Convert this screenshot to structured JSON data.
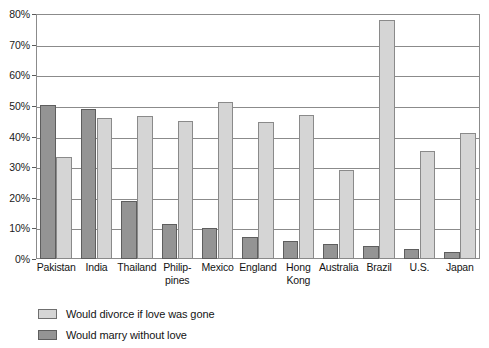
{
  "chart_data": {
    "type": "bar",
    "title": "",
    "subtitle": "",
    "xlabel": "",
    "ylabel": "",
    "ylim": [
      0,
      80
    ],
    "ytick_step": 10,
    "ytick_labels": [
      "0%",
      "10%",
      "20%",
      "30%",
      "40%",
      "50%",
      "60%",
      "70%",
      "80%"
    ],
    "grid": true,
    "legend_position": "below-plot-left",
    "orientation": "vertical",
    "grouping": "grouped",
    "categories": [
      "Pakistan",
      "India",
      "Thailand",
      "Philippines",
      "Mexico",
      "England",
      "Hong Kong",
      "Australia",
      "Brazil",
      "U.S.",
      "Japan"
    ],
    "category_label_lines": [
      [
        "Pakistan"
      ],
      [
        "India"
      ],
      [
        "Thailand"
      ],
      [
        "Philip-",
        "pines"
      ],
      [
        "Mexico"
      ],
      [
        "England"
      ],
      [
        "Hong",
        "Kong"
      ],
      [
        "Australia"
      ],
      [
        "Brazil"
      ],
      [
        "U.S."
      ],
      [
        "Japan"
      ]
    ],
    "series": [
      {
        "name": "Would marry without love",
        "color": "#949494",
        "values": [
          50.4,
          49.0,
          18.8,
          11.4,
          10.2,
          7.3,
          5.8,
          4.8,
          4.3,
          3.4,
          2.3
        ]
      },
      {
        "name": "Would divorce if love was gone",
        "color": "#d5d5d5",
        "values": [
          33.2,
          46.0,
          46.8,
          45.2,
          51.4,
          44.6,
          47.0,
          29.0,
          78.0,
          35.4,
          41.1
        ]
      }
    ]
  },
  "legend": {
    "items": [
      {
        "label": "Would divorce if love was gone",
        "swatch": "light"
      },
      {
        "label": "Would marry without love",
        "swatch": "dark"
      }
    ]
  },
  "colors": {
    "series_light": "#d5d5d5",
    "series_dark": "#949494",
    "gridline": "#8b8b8b",
    "frame": "#8b8b8b",
    "text": "#141414",
    "background": "#ffffff"
  }
}
